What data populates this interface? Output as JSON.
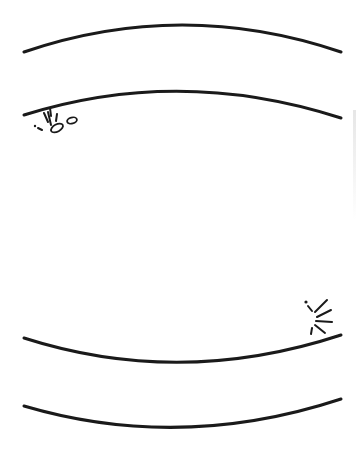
{
  "illustration": {
    "subject": "line drawing of curved bands with crack/debris marks",
    "colors": {
      "background": "#ffffff",
      "ink": "#1a1a1a",
      "faint": "#e6e6e6"
    },
    "stroke_width": 3,
    "arcs": [
      {
        "name": "top-arc-outer",
        "d": "M24 52 Q182 -2 341 52"
      },
      {
        "name": "top-arc-inner",
        "d": "M24 115 Q180 66 341 118"
      },
      {
        "name": "bottom-arc-inner",
        "d": "M24 338 Q180 388 341 335"
      },
      {
        "name": "bottom-arc-outer",
        "d": "M24 406 Q180 452 341 399"
      }
    ],
    "crack_clusters": [
      {
        "name": "upper-left-crack",
        "lines": [
          {
            "x1": 50,
            "y1": 108,
            "x2": 51,
            "y2": 116
          },
          {
            "x1": 44,
            "y1": 113,
            "x2": 48,
            "y2": 122
          },
          {
            "x1": 48,
            "y1": 112,
            "x2": 51,
            "y2": 125
          },
          {
            "x1": 57,
            "y1": 114,
            "x2": 56,
            "y2": 121
          },
          {
            "x1": 38,
            "y1": 128,
            "x2": 42,
            "y2": 130
          }
        ],
        "dots": [
          {
            "cx": 35,
            "cy": 126,
            "r": 1.2
          }
        ],
        "pebbles": [
          {
            "cx": 57,
            "cy": 128,
            "rx": 6.5,
            "ry": 3.6,
            "rotate": -28
          },
          {
            "cx": 72,
            "cy": 120.5,
            "rx": 5,
            "ry": 3,
            "rotate": -15
          }
        ]
      },
      {
        "name": "lower-right-crack",
        "lines": [
          {
            "x1": 308,
            "y1": 306,
            "x2": 312,
            "y2": 311
          },
          {
            "x1": 315,
            "y1": 312,
            "x2": 327,
            "y2": 300
          },
          {
            "x1": 317,
            "y1": 317,
            "x2": 331,
            "y2": 310
          },
          {
            "x1": 316,
            "y1": 321,
            "x2": 332,
            "y2": 322
          },
          {
            "x1": 315,
            "y1": 325,
            "x2": 325,
            "y2": 333
          },
          {
            "x1": 312,
            "y1": 328,
            "x2": 311,
            "y2": 334
          }
        ],
        "dots": [
          {
            "cx": 306,
            "cy": 302,
            "r": 1.6
          }
        ],
        "pebbles": []
      }
    ]
  }
}
